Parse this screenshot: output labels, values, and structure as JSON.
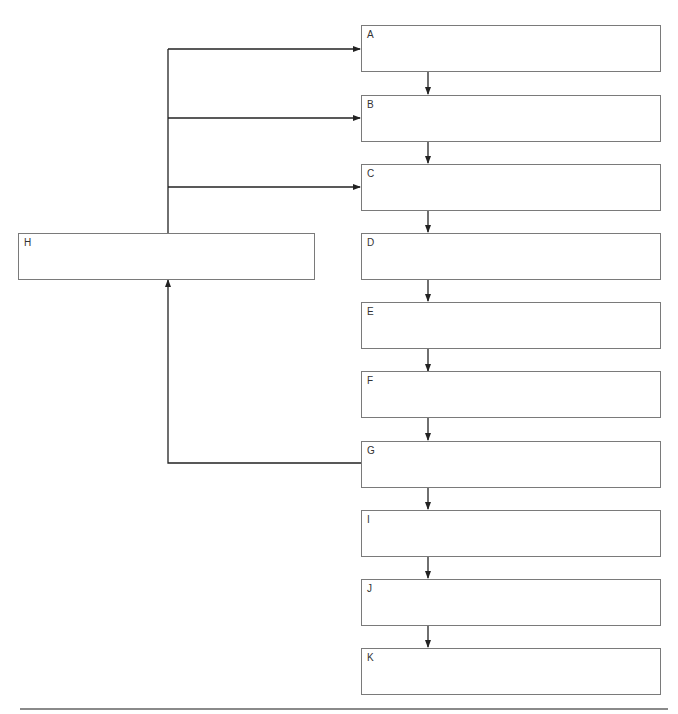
{
  "diagram": {
    "type": "flowchart",
    "colors": {
      "line": "#222222",
      "box_border": "#7a7a7a",
      "background": "#ffffff",
      "rule": "#8a8a8a"
    },
    "right_column": [
      {
        "id": "A",
        "label": "A"
      },
      {
        "id": "B",
        "label": "B"
      },
      {
        "id": "C",
        "label": "C"
      },
      {
        "id": "D",
        "label": "D"
      },
      {
        "id": "E",
        "label": "E"
      },
      {
        "id": "F",
        "label": "F"
      },
      {
        "id": "G",
        "label": "G"
      },
      {
        "id": "I",
        "label": "I"
      },
      {
        "id": "J",
        "label": "J"
      },
      {
        "id": "K",
        "label": "K"
      }
    ],
    "side_node": {
      "id": "H",
      "label": "H"
    },
    "edges": [
      [
        "A",
        "B"
      ],
      [
        "B",
        "C"
      ],
      [
        "C",
        "D"
      ],
      [
        "D",
        "E"
      ],
      [
        "E",
        "F"
      ],
      [
        "F",
        "G"
      ],
      [
        "G",
        "I"
      ],
      [
        "I",
        "J"
      ],
      [
        "J",
        "K"
      ],
      [
        "G",
        "H"
      ],
      [
        "H",
        "A"
      ],
      [
        "H",
        "B"
      ],
      [
        "H",
        "C"
      ]
    ]
  }
}
